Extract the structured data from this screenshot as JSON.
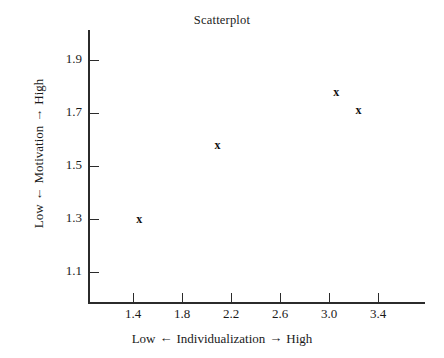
{
  "chart_data": {
    "type": "scatter",
    "title": "Scatterplot",
    "xlabel": "Low ← Individualization → High",
    "ylabel": "Low ← Motivation → High",
    "xlabel_parts": {
      "low": "Low",
      "arrow_left": "←",
      "name": "Individualization",
      "arrow_right": "→",
      "high": "High"
    },
    "ylabel_parts": {
      "low": "Low",
      "arrow_down": "←",
      "name": "Motivation",
      "arrow_up": "→",
      "high": "High"
    },
    "xlim": [
      1.2,
      3.95
    ],
    "ylim": [
      1.0,
      2.0
    ],
    "xticks": [
      1.4,
      1.8,
      2.2,
      2.6,
      3.0,
      3.4
    ],
    "yticks": [
      1.1,
      1.3,
      1.5,
      1.7,
      1.9
    ],
    "xtick_labels": [
      "1.4",
      "1.8",
      "2.2",
      "2.6",
      "3.0",
      "3.4"
    ],
    "ytick_labels": [
      "1.1",
      "1.3",
      "1.5",
      "1.7",
      "1.9"
    ],
    "grid": false,
    "legend": null,
    "marker": "x",
    "points": [
      {
        "x": 1.45,
        "y": 1.3
      },
      {
        "x": 2.09,
        "y": 1.58
      },
      {
        "x": 3.06,
        "y": 1.78
      },
      {
        "x": 3.24,
        "y": 1.71
      }
    ]
  },
  "colors": {
    "axis": "#2b2b2b",
    "text": "#1a1a1a",
    "marker": "#111111",
    "background": "#ffffff"
  }
}
